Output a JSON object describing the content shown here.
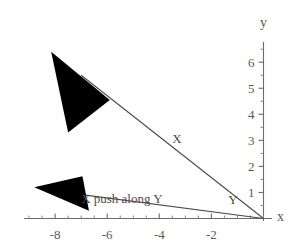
{
  "chart_data": {
    "type": "scatter",
    "title": "",
    "xlabel": "x",
    "ylabel": "y",
    "xlim": [
      -9.6,
      1.2
    ],
    "ylim": [
      -0.55,
      6.6
    ],
    "grid": false,
    "legend": "none",
    "xticks": [
      -8,
      -6,
      -4,
      -2
    ],
    "xtick_labels": [
      "-8",
      "-6",
      "-4",
      "-2"
    ],
    "yticks": [
      1,
      2,
      3,
      4,
      5,
      6
    ],
    "ytick_labels": [
      "1",
      "2",
      "3",
      "4",
      "5",
      "6"
    ],
    "xminor_step": 0.5,
    "yminor_step": 0.5,
    "annotations": [
      {
        "text": "X",
        "x": -3.5,
        "y": 3.05
      },
      {
        "text": "X push along Y",
        "x": -7.0,
        "y": 0.75
      },
      {
        "text": "Y",
        "x": -1.35,
        "y": 0.7
      }
    ],
    "vectors": [
      {
        "name": "X",
        "label": "X",
        "tail": [
          0,
          0
        ],
        "tip": [
          -7.0,
          5.5
        ],
        "arrow_tip": [
          -8.15,
          6.4
        ],
        "arrow_wing_a": [
          -7.5,
          3.3
        ],
        "arrow_wing_b": [
          -5.9,
          4.55
        ],
        "style": "solid-filled-arrowhead"
      },
      {
        "name": "X push along Y",
        "label": "X push along Y",
        "tail": [
          0,
          0
        ],
        "tip": [
          -8.0,
          1.05
        ],
        "arrow_tip": [
          -8.8,
          1.2
        ],
        "arrow_wing_a": [
          -6.95,
          1.62
        ],
        "arrow_wing_b": [
          -6.7,
          0.3
        ],
        "style": "solid-filled-arrowhead"
      }
    ]
  },
  "axes": {
    "x_axis_label": "x",
    "y_axis_label": "y"
  },
  "colors": {
    "axis": "#6b6b6b",
    "text": "#595959",
    "vector_line": "#4a4a4a",
    "arrowhead_fill": "#000000",
    "background": "#ffffff"
  }
}
